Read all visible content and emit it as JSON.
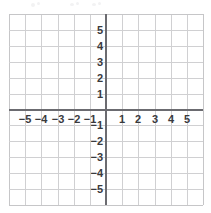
{
  "chart_data": {
    "type": "scatter",
    "title": "",
    "subtitle": "",
    "xlabel": "",
    "ylabel": "",
    "xlim": [
      -6,
      6
    ],
    "ylim": [
      -6,
      6
    ],
    "grid": true,
    "legend": null,
    "series": [],
    "annotations": [],
    "x_tick_labels": [
      "−5",
      "−4",
      "−3",
      "−2",
      "−1",
      "1",
      "2",
      "3",
      "4",
      "5"
    ],
    "x_tick_values": [
      -5,
      -4,
      -3,
      -2,
      -1,
      1,
      2,
      3,
      4,
      5
    ],
    "y_tick_labels": [
      "5",
      "4",
      "3",
      "2",
      "1",
      "−1",
      "−2",
      "−3",
      "−4",
      "−5"
    ],
    "y_tick_values": [
      5,
      4,
      3,
      2,
      1,
      -1,
      -2,
      -3,
      -4,
      -5
    ],
    "origin_label": "",
    "grid_step": 1,
    "grid_columns": 12,
    "grid_rows": 12
  },
  "colors": {
    "background": "#ffffff",
    "grid_line": "#d0d0d2",
    "grid_edge": "#c6c6c8",
    "axis": "#6b6b70",
    "label_text": "#3a3a3d"
  },
  "figure": {
    "name": "blank-cartesian-coordinate-plane"
  }
}
